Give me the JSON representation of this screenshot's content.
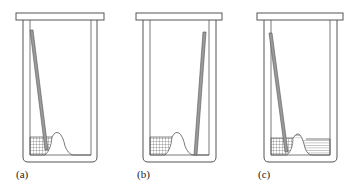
{
  "figure": {
    "panels": [
      {
        "id": "a",
        "label": "(a)",
        "rod_position": "left",
        "right_region": "empty"
      },
      {
        "id": "b",
        "label": "(b)",
        "rod_position": "right",
        "right_region": "empty"
      },
      {
        "id": "c",
        "label": "(c)",
        "rod_position": "left",
        "right_region": "striped"
      }
    ],
    "colors": {
      "stroke": "#555555",
      "rod_fill": "#9a9a9a",
      "background": "#ffffff"
    }
  }
}
